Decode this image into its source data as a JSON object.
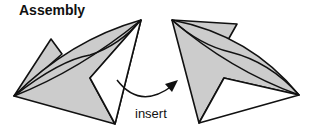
{
  "diagram": {
    "title": "Assembly",
    "arrow_label": "insert",
    "colors": {
      "fill": "#cccccc",
      "stroke": "#111111"
    },
    "shapes": [
      {
        "name": "left-piece",
        "state": "before"
      },
      {
        "name": "right-piece",
        "state": "after"
      }
    ]
  }
}
